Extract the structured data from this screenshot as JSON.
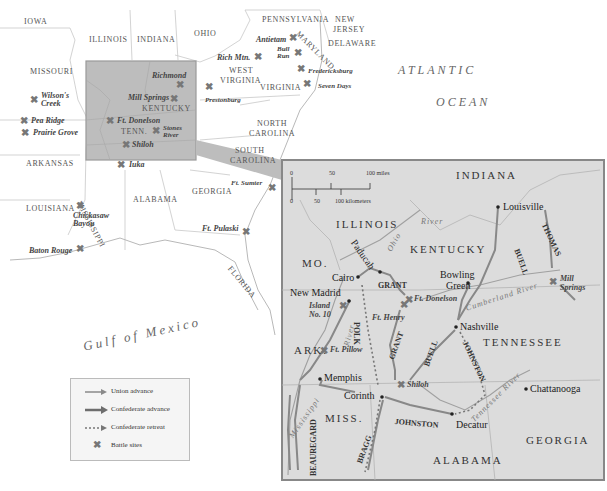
{
  "main_map": {
    "states": [
      {
        "name": "IOWA",
        "x": 24,
        "y": 18
      },
      {
        "name": "ILLINOIS",
        "x": 89,
        "y": 36
      },
      {
        "name": "INDIANA",
        "x": 137,
        "y": 36
      },
      {
        "name": "OHIO",
        "x": 194,
        "y": 30
      },
      {
        "name": "PENNSYLVANIA",
        "x": 262,
        "y": 16
      },
      {
        "name": "NEW",
        "x": 335,
        "y": 16
      },
      {
        "name": "JERSEY",
        "x": 333,
        "y": 26
      },
      {
        "name": "DELAWARE",
        "x": 328,
        "y": 40
      },
      {
        "name": "WEST",
        "x": 229,
        "y": 67
      },
      {
        "name": "VIRGINIA",
        "x": 220,
        "y": 77
      },
      {
        "name": "VIRGINIA",
        "x": 260,
        "y": 84
      },
      {
        "name": "MISSOURI",
        "x": 30,
        "y": 68
      },
      {
        "name": "KENTUCKY",
        "x": 142,
        "y": 105
      },
      {
        "name": "TENN.",
        "x": 121,
        "y": 128
      },
      {
        "name": "NORTH",
        "x": 257,
        "y": 120
      },
      {
        "name": "CAROLINA",
        "x": 249,
        "y": 130
      },
      {
        "name": "SOUTH",
        "x": 235,
        "y": 147
      },
      {
        "name": "CAROLINA",
        "x": 230,
        "y": 157
      },
      {
        "name": "ARKANSAS",
        "x": 26,
        "y": 160
      },
      {
        "name": "GEORGIA",
        "x": 192,
        "y": 188
      },
      {
        "name": "ALABAMA",
        "x": 133,
        "y": 196
      },
      {
        "name": "LOUISIANA",
        "x": 26,
        "y": 205
      }
    ],
    "rotated_states": [
      {
        "name": "MISSISSIPPI",
        "x": 85,
        "y": 180,
        "rotate": 62
      },
      {
        "name": "MARYLAND",
        "x": 300,
        "y": 40,
        "rotate": 45
      },
      {
        "name": "FLORIDA",
        "x": 232,
        "y": 270,
        "rotate": 50
      }
    ],
    "oceans": [
      {
        "name": "ATLANTIC",
        "x": 398,
        "y": 64
      },
      {
        "name": "OCEAN",
        "x": 436,
        "y": 96
      },
      {
        "name": "Gulf of Mexico",
        "x": 82,
        "y": 334
      }
    ],
    "battles": [
      {
        "name": "Antietam",
        "x": 256,
        "y": 36,
        "xx": 290,
        "xy": 34
      },
      {
        "name": "Rich Mtn.",
        "x": 217,
        "y": 54,
        "xx": 254,
        "xy": 53
      },
      {
        "name": "Bull Run",
        "x": 277,
        "y": 47,
        "xx": 293,
        "xy": 49
      },
      {
        "name": "Bull Run2",
        "x": 0,
        "y": 0,
        "xx": 0,
        "xy": 0
      },
      {
        "name": "Fredericksburg",
        "x": 308,
        "y": 69,
        "xx": 297,
        "xy": 66
      },
      {
        "name": "Seven Days",
        "x": 318,
        "y": 84,
        "xx": 302,
        "xy": 80
      },
      {
        "name": "Prestonburg",
        "x": 205,
        "y": 97,
        "xx": 205,
        "xy": 82
      },
      {
        "name": "Richmond",
        "x": 152,
        "y": 72,
        "xx": 176,
        "xy": 80
      },
      {
        "name": "Mill Springs",
        "x": 128,
        "y": 94,
        "xx": 170,
        "xy": 96
      },
      {
        "name": "Ft. Donelson",
        "x": 117,
        "y": 120,
        "xx": 105,
        "xy": 119
      },
      {
        "name": "Stones River",
        "x": 163,
        "y": 128,
        "xx": 152,
        "xy": 128
      },
      {
        "name": "Shiloh",
        "x": 132,
        "y": 143,
        "xx": 122,
        "xy": 143
      },
      {
        "name": "Iuka",
        "x": 129,
        "y": 162,
        "xx": 117,
        "xy": 162
      },
      {
        "name": "Wilson's Creek",
        "x": 41,
        "y": 93,
        "xx": 31,
        "xy": 97
      },
      {
        "name": "Pea Ridge",
        "x": 31,
        "y": 118,
        "xx": 20,
        "xy": 117
      },
      {
        "name": "Prairie Grove",
        "x": 33,
        "y": 130,
        "xx": 21,
        "xy": 129
      },
      {
        "name": "Chickasaw Bayou",
        "x": 73,
        "y": 213,
        "xx": 76,
        "xy": 202
      },
      {
        "name": "Baton Rouge",
        "x": 29,
        "y": 248,
        "xx": 76,
        "xy": 245
      },
      {
        "name": "Ft. Sumter",
        "x": 231,
        "y": 180,
        "xx": 268,
        "xy": 185
      },
      {
        "name": "Ft. Pulaski",
        "x": 202,
        "y": 225,
        "xx": 242,
        "xy": 229
      }
    ]
  },
  "inset": {
    "scale": {
      "miles_ticks": [
        "0",
        "50",
        "100 miles"
      ],
      "km_ticks": [
        "0",
        "50",
        "100 kilometers"
      ]
    },
    "states": [
      {
        "name": "INDIANA",
        "x": 456,
        "y": 170
      },
      {
        "name": "ILLINOIS",
        "x": 336,
        "y": 220
      },
      {
        "name": "MO.",
        "x": 302,
        "y": 260
      },
      {
        "name": "KENTUCKY",
        "x": 410,
        "y": 245
      },
      {
        "name": "TENNESSEE",
        "x": 483,
        "y": 338
      },
      {
        "name": "ARK.",
        "x": 294,
        "y": 346
      },
      {
        "name": "MISS.",
        "x": 325,
        "y": 414
      },
      {
        "name": "ALABAMA",
        "x": 433,
        "y": 456
      },
      {
        "name": "GEORGIA",
        "x": 526,
        "y": 436
      }
    ],
    "cities": [
      {
        "name": "Louisville",
        "x": 500,
        "y": 203,
        "dx": 498,
        "dy": 207
      },
      {
        "name": "Bowling",
        "x": 400,
        "y": 274,
        "dx": 0,
        "dy": 0
      },
      {
        "name": "Green",
        "x": 406,
        "y": 284,
        "dx": 468,
        "dy": 283
      },
      {
        "name": "Cairo",
        "x": 332,
        "y": 274,
        "dx": 357,
        "dy": 277
      },
      {
        "name": "New Madrid",
        "x": 290,
        "y": 288,
        "dx": 347,
        "dy": 300
      },
      {
        "name": "Nashville",
        "x": 460,
        "y": 323,
        "dx": 456,
        "dy": 327
      },
      {
        "name": "Memphis",
        "x": 325,
        "y": 376,
        "dx": 320,
        "dy": 379
      },
      {
        "name": "Corinth",
        "x": 344,
        "y": 393,
        "dx": 382,
        "dy": 397
      },
      {
        "name": "Chattanooga",
        "x": 530,
        "y": 385,
        "dx": 526,
        "dy": 389
      },
      {
        "name": "Decatur",
        "x": 457,
        "y": 423,
        "dx": 452,
        "dy": 414
      }
    ],
    "battles": [
      {
        "name": "Island",
        "x": 309,
        "y": 302
      },
      {
        "name": "No. 10",
        "x": 309,
        "y": 311
      },
      {
        "name": "Ft. Donelson",
        "x": 414,
        "y": 296
      },
      {
        "name": "Ft. Henry",
        "x": 372,
        "y": 314
      },
      {
        "name": "Ft. Pillow",
        "x": 330,
        "y": 346
      },
      {
        "name": "Shiloh",
        "x": 407,
        "y": 381
      },
      {
        "name": "Mill",
        "x": 560,
        "y": 276
      },
      {
        "name": "Springs",
        "x": 560,
        "y": 285
      }
    ],
    "armies": [
      {
        "name": "GRANT",
        "x": 378,
        "y": 283,
        "rotate": 0
      },
      {
        "name": "GRANT",
        "x": 387,
        "y": 340,
        "rotate": -70
      },
      {
        "name": "BUELL",
        "x": 520,
        "y": 258,
        "rotate": 70
      },
      {
        "name": "BUELL",
        "x": 421,
        "y": 350,
        "rotate": -70
      },
      {
        "name": "THOMAS",
        "x": 547,
        "y": 223,
        "rotate": 65
      },
      {
        "name": "POLK",
        "x": 352,
        "y": 331,
        "rotate": 90
      },
      {
        "name": "JOHNSTON",
        "x": 460,
        "y": 362,
        "rotate": 65
      },
      {
        "name": "JOHNSTON",
        "x": 428,
        "y": 424,
        "rotate": 5
      },
      {
        "name": "BRAGG",
        "x": 356,
        "y": 437,
        "rotate": -70
      },
      {
        "name": "BEAUREGARD",
        "x": 299,
        "y": 445,
        "rotate": -90
      },
      {
        "name": "Paducah",
        "x": 354,
        "y": 256,
        "rotate": 55
      }
    ],
    "rivers": [
      {
        "name": "Ohio",
        "x": 388,
        "y": 239,
        "rotate": -60
      },
      {
        "name": "River",
        "x": 421,
        "y": 222,
        "rotate": 0
      },
      {
        "name": "Cumberland River",
        "x": 468,
        "y": 301,
        "rotate": -18
      },
      {
        "name": "River",
        "x": 341,
        "y": 336,
        "rotate": -75
      },
      {
        "name": "Mississippi",
        "x": 292,
        "y": 417,
        "rotate": -55
      },
      {
        "name": "Tennessee River",
        "x": 474,
        "y": 406,
        "rotate": -45
      }
    ]
  },
  "legend": {
    "items": [
      {
        "label": "Union advance",
        "type": "union"
      },
      {
        "label": "Confederate advance",
        "type": "confederate"
      },
      {
        "label": "Confederate retreat",
        "type": "retreat"
      },
      {
        "label": "Battle sites",
        "type": "battle"
      }
    ]
  },
  "colors": {
    "highlight_box": "#bdbdbd",
    "inset_bg": "#dcdcdc",
    "union_arrow": "#8a8a8a",
    "confederate_arrow": "#6e6e6e",
    "battle_x": "#777777"
  }
}
